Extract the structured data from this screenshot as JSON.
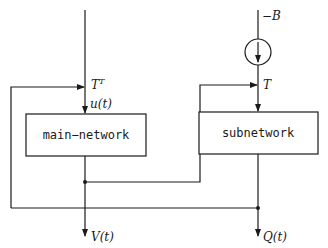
{
  "diagram": {
    "type": "block-diagram",
    "blocks": [
      {
        "id": "main",
        "label": "main−network"
      },
      {
        "id": "sub",
        "label": "subnetwork"
      }
    ],
    "labels": {
      "neg_b": "−B",
      "t_transpose_base": "T",
      "t_transpose_sup": "T",
      "u": "u(t)",
      "t": "T",
      "v": "V(t)",
      "q": "Q(t)"
    },
    "elements": {
      "current_source": "circle with downward arrow on right input line"
    },
    "colors": {
      "stroke": "#1a1a1a",
      "background": "#ffffff"
    }
  }
}
